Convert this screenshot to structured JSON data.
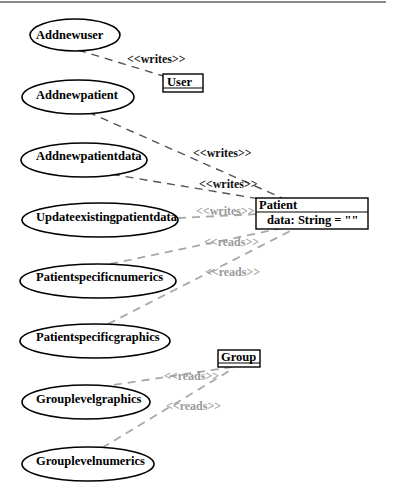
{
  "diagram": {
    "type": "UML use case / class dependency diagram",
    "use_cases": [
      {
        "id": "uc1",
        "label": "Addnewuser"
      },
      {
        "id": "uc2",
        "label": "Addnewpatient"
      },
      {
        "id": "uc3",
        "label": "Addnewpatientdata"
      },
      {
        "id": "uc4",
        "label": "Updateexistingpatientdata"
      },
      {
        "id": "uc5",
        "label": "Patientspecificnumerics"
      },
      {
        "id": "uc6",
        "label": "Patientspecificgraphics"
      },
      {
        "id": "uc7",
        "label": "Grouplevelgraphics"
      },
      {
        "id": "uc8",
        "label": "Grouplevelnumerics"
      }
    ],
    "classes": {
      "user": {
        "name": "User"
      },
      "patient": {
        "name": "Patient",
        "attribute": "data: String = \"\""
      },
      "group": {
        "name": "Group"
      }
    },
    "relations": [
      {
        "from": "Addnewuser",
        "to": "User",
        "label": "<<writes>>"
      },
      {
        "from": "Addnewpatient",
        "to": "Patient",
        "label": "<<writes>>"
      },
      {
        "from": "Addnewpatientdata",
        "to": "Patient",
        "label": "<<writes>>"
      },
      {
        "from": "Updateexistingpatientdata",
        "to": "Patient",
        "label": "<<writes>>"
      },
      {
        "from": "Patientspecificnumerics",
        "to": "Patient",
        "label": "<<reads>>"
      },
      {
        "from": "Patientspecificgraphics",
        "to": "Patient",
        "label": "<<reads>>"
      },
      {
        "from": "Grouplevelgraphics",
        "to": "Group",
        "label": "<<reads>>"
      },
      {
        "from": "Grouplevelnumerics",
        "to": "Group",
        "label": "<<reads>>"
      }
    ],
    "colors": {
      "writes_edge": "#555555",
      "reads_edge": "#a8a8a8",
      "reads_label": "#9a9a9a",
      "outline": "#000000"
    }
  }
}
